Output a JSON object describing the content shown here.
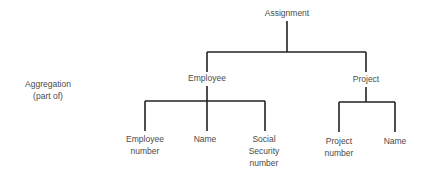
{
  "diagram": {
    "side_label": [
      "Aggregation",
      "(part of)"
    ],
    "root": "Assignment",
    "level1": [
      {
        "label": "Employee",
        "children": [
          [
            "Employee",
            "number"
          ],
          [
            "Name"
          ],
          [
            "Social",
            "Security",
            "number"
          ]
        ]
      },
      {
        "label": "Project",
        "children": [
          [
            "Project",
            "number"
          ],
          [
            "Name"
          ]
        ]
      }
    ]
  }
}
